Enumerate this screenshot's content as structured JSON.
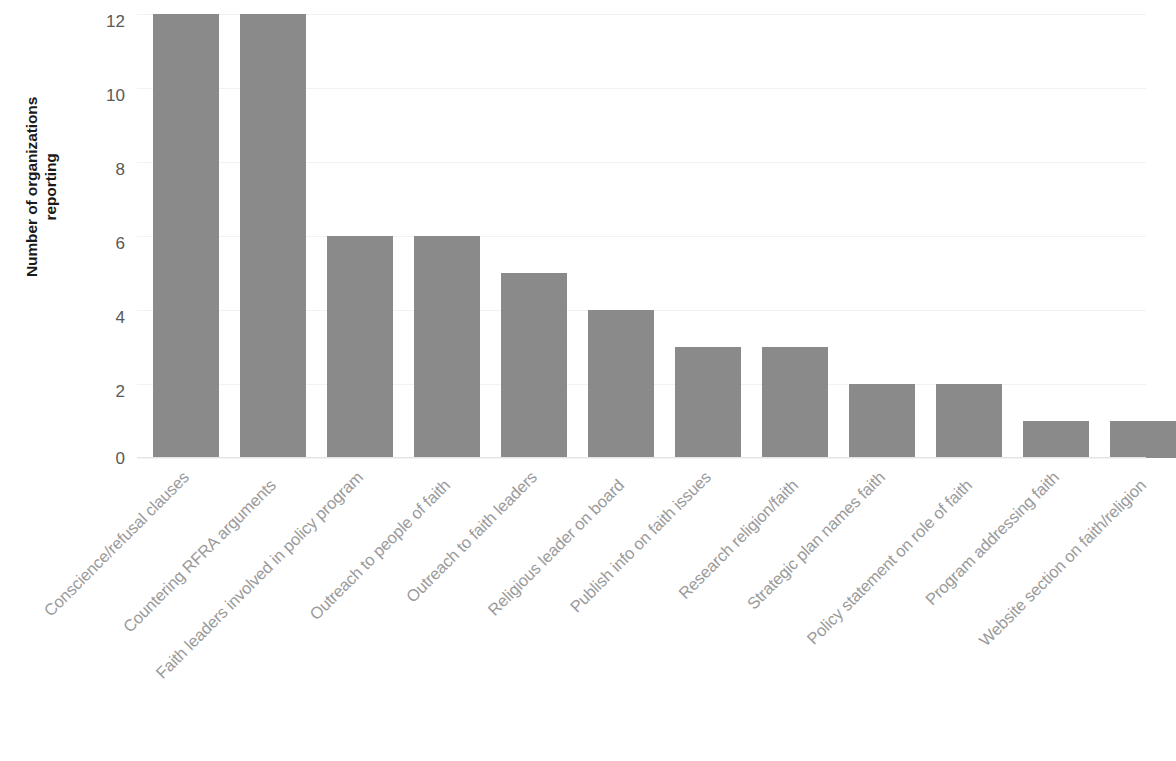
{
  "chart_data": {
    "type": "bar",
    "title": "",
    "subtitle": "",
    "xlabel": "",
    "ylabel": "Number of organizations reporting",
    "ylabel_lines": [
      "Number of organizations",
      "reporting"
    ],
    "ylim": [
      0,
      12
    ],
    "yticks": [
      0,
      2,
      4,
      6,
      8,
      10,
      12
    ],
    "ytick_labels": [
      "0",
      "2",
      "4",
      "6",
      "8",
      "10",
      "12"
    ],
    "grid": true,
    "grid_axis": "y",
    "legend": null,
    "legend_position": "none",
    "bar_color": "#8a8a8a",
    "categories": [
      "Conscience/refusal clauses",
      "Countering RFRA arguments",
      "Faith leaders involved in  policy program",
      "Outreach to people of faith",
      "Outreach to faith leaders",
      "Religious leader on board",
      "Publish info on faith issues",
      "Research religion/faith",
      "Strategic plan names faith",
      "Policy statement on role of faith",
      "Program addressing faith",
      "Website section on faith/religion"
    ],
    "values": [
      12,
      12,
      6,
      6,
      5,
      4,
      3,
      3,
      2,
      2,
      1,
      1
    ]
  },
  "axis": {
    "y_title_line1": "Number of organizations",
    "y_title_line2": "reporting",
    "tick_0": "0",
    "tick_2": "2",
    "tick_4": "4",
    "tick_6": "6",
    "tick_8": "8",
    "tick_10": "10",
    "tick_12": "12"
  }
}
